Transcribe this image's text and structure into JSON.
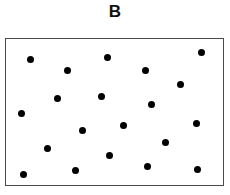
{
  "figure": {
    "title": "B",
    "title_color": "#111111",
    "background_color": "#ffffff"
  },
  "plot_frame": {
    "x": 5,
    "y": 38,
    "width": 219,
    "height": 148,
    "border_color": "#4a4a4a",
    "border_width": 1.5,
    "fill_color": "#ffffff"
  },
  "chart_data": {
    "type": "scatter",
    "title": "B",
    "xlabel": "",
    "ylabel": "",
    "xlim": [
      0,
      230
    ],
    "ylim": [
      0,
      195
    ],
    "grid": false,
    "legend": null,
    "marker": {
      "shape": "circle",
      "color": "#000000",
      "diameter": 7.5,
      "count": 20
    },
    "series": [
      {
        "name": "points",
        "color": "#000000",
        "points": [
          {
            "x": 31,
            "y": 60
          },
          {
            "x": 68,
            "y": 71
          },
          {
            "x": 108,
            "y": 58
          },
          {
            "x": 146,
            "y": 71
          },
          {
            "x": 202,
            "y": 53
          },
          {
            "x": 181,
            "y": 85
          },
          {
            "x": 58,
            "y": 99
          },
          {
            "x": 102,
            "y": 97
          },
          {
            "x": 152,
            "y": 105
          },
          {
            "x": 22,
            "y": 114
          },
          {
            "x": 83,
            "y": 131
          },
          {
            "x": 124,
            "y": 126
          },
          {
            "x": 197,
            "y": 124
          },
          {
            "x": 48,
            "y": 149
          },
          {
            "x": 166,
            "y": 143
          },
          {
            "x": 110,
            "y": 156
          },
          {
            "x": 24,
            "y": 175
          },
          {
            "x": 76,
            "y": 171
          },
          {
            "x": 148,
            "y": 167
          },
          {
            "x": 198,
            "y": 170
          }
        ]
      }
    ]
  }
}
